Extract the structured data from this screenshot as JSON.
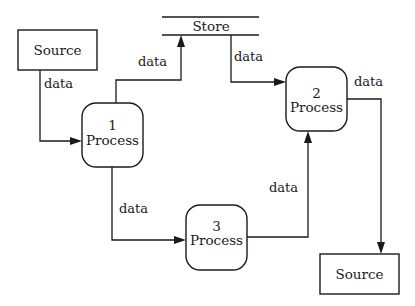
{
  "diagram": {
    "type": "data-flow-diagram",
    "colors": {
      "stroke": "#1a1a1a",
      "fill": "#ffffff",
      "background": "#ffffff"
    },
    "nodes": {
      "source_in": {
        "kind": "external-entity",
        "label": "Source"
      },
      "store": {
        "kind": "data-store",
        "label": "Store"
      },
      "process1": {
        "kind": "process",
        "number": "1",
        "label": "Process"
      },
      "process2": {
        "kind": "process",
        "number": "2",
        "label": "Process"
      },
      "process3": {
        "kind": "process",
        "number": "3",
        "label": "Process"
      },
      "source_out": {
        "kind": "external-entity",
        "label": "Source"
      }
    },
    "flows": [
      {
        "from": "source_in",
        "to": "process1",
        "label": "data"
      },
      {
        "from": "process1",
        "to": "store",
        "label": "data"
      },
      {
        "from": "store",
        "to": "process2",
        "label": "data"
      },
      {
        "from": "process1",
        "to": "process3",
        "label": "data"
      },
      {
        "from": "process3",
        "to": "process2",
        "label": "data"
      },
      {
        "from": "process2",
        "to": "source_out",
        "label": "data"
      }
    ]
  }
}
